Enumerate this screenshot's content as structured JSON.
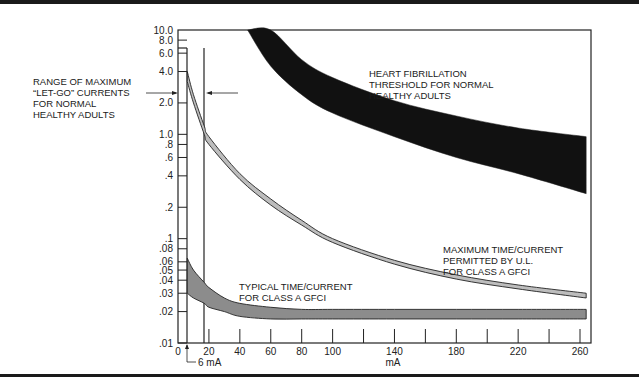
{
  "chart_data": {
    "type": "area",
    "title": "",
    "xlabel": "mA",
    "ylabel": "",
    "xlim": [
      0,
      270
    ],
    "ylim": [
      0.01,
      10.0
    ],
    "yscale": "log",
    "grid": false,
    "x_ticks": [
      0,
      20,
      40,
      60,
      80,
      100,
      140,
      180,
      220,
      260
    ],
    "x_minor_ticks": [
      20,
      40,
      60,
      80,
      100,
      120,
      140,
      160,
      180,
      200,
      220,
      240,
      260
    ],
    "y_ticks": [
      "10.0",
      "8.0",
      "6.0",
      "4.0",
      "2.0",
      "1.0",
      ".8",
      ".6",
      ".4",
      ".2",
      ".1",
      ".08",
      ".06",
      ".05",
      ".04",
      ".03",
      ".02",
      ".01"
    ],
    "y_tick_values": [
      10.0,
      8.0,
      6.0,
      4.0,
      2.0,
      1.0,
      0.8,
      0.6,
      0.4,
      0.2,
      0.1,
      0.08,
      0.06,
      0.05,
      0.04,
      0.03,
      0.02,
      0.01
    ],
    "series": [
      {
        "name": "Heart fibrillation threshold for normal healthy adults",
        "style": "band",
        "color": "#111111",
        "x": [
          45,
          60,
          80,
          100,
          140,
          180,
          220,
          264
        ],
        "upper": [
          10.0,
          10.0,
          5.2,
          3.5,
          2.1,
          1.5,
          1.15,
          0.95
        ],
        "lower": [
          10.0,
          4.5,
          2.4,
          1.6,
          0.95,
          0.6,
          0.42,
          0.27
        ]
      },
      {
        "name": "Maximum time/current permitted by U.L. for Class A GFCI",
        "style": "band",
        "color": "#bdbdbd",
        "x": [
          6,
          10,
          17,
          20,
          40,
          60,
          80,
          100,
          140,
          180,
          220,
          264
        ],
        "upper": [
          4.0,
          2.4,
          1.2,
          0.95,
          0.42,
          0.24,
          0.15,
          0.1,
          0.062,
          0.045,
          0.036,
          0.03
        ],
        "lower": [
          3.2,
          2.0,
          1.0,
          0.8,
          0.37,
          0.21,
          0.135,
          0.092,
          0.057,
          0.041,
          0.033,
          0.027
        ]
      },
      {
        "name": "Typical time/current for Class A GFCI",
        "style": "band",
        "color": "#8c8c8c",
        "x": [
          6,
          10,
          17,
          20,
          30,
          40,
          60,
          80,
          100,
          140,
          180,
          220,
          264
        ],
        "upper": [
          0.065,
          0.05,
          0.038,
          0.034,
          0.027,
          0.024,
          0.022,
          0.021,
          0.021,
          0.021,
          0.021,
          0.021,
          0.021
        ],
        "lower": [
          0.03,
          0.027,
          0.024,
          0.022,
          0.02,
          0.018,
          0.017,
          0.017,
          0.017,
          0.017,
          0.017,
          0.017,
          0.017
        ]
      }
    ],
    "reference_lines": [
      {
        "axis": "x",
        "value": 6,
        "label": "6 mA"
      },
      {
        "axis": "x",
        "value": 17,
        "label": ""
      }
    ],
    "annotations": [
      {
        "text": "RANGE OF MAXIMUM \"LET-GO\" CURRENTS FOR NORMAL HEALTHY ADULTS",
        "points_to": "6–17 mA"
      },
      {
        "text": "HEART FIBRILLATION THRESHOLD FOR NORMAL HEALTHY ADULTS"
      },
      {
        "text": "MAXIMUM TIME/CURRENT PERMITTED BY U.L. FOR CLASS A GFCI"
      },
      {
        "text": "TYPICAL TIME/CURRENT FOR CLASS A GFCI"
      }
    ]
  },
  "labels": {
    "letgo": [
      "RANGE OF MAXIMUM",
      "“LET-GO” CURRENTS",
      "FOR NORMAL",
      "HEALTHY ADULTS"
    ],
    "fibrillation": [
      "HEART FIBRILLATION",
      "THRESHOLD FOR NORMAL",
      "HEALTHY ADULTS"
    ],
    "ul_max": [
      "MAXIMUM TIME/CURRENT",
      "PERMITTED BY U.L.",
      "FOR CLASS A GFCI"
    ],
    "typical": [
      "TYPICAL TIME/CURRENT",
      "FOR CLASS A GFCI"
    ],
    "six_ma": "6 mA",
    "x_unit": "mA"
  },
  "axis_labels": {
    "y": [
      "10.0",
      "8.0",
      "6.0",
      "4.0",
      "2.0",
      "1.0",
      ".8",
      ".6",
      ".4",
      ".2",
      ".1",
      ".08",
      ".06",
      ".05",
      ".04",
      ".03",
      ".02",
      ".01"
    ],
    "x": [
      "0",
      "20",
      "40",
      "60",
      "80",
      "100",
      "140",
      "180",
      "220",
      "260"
    ]
  }
}
